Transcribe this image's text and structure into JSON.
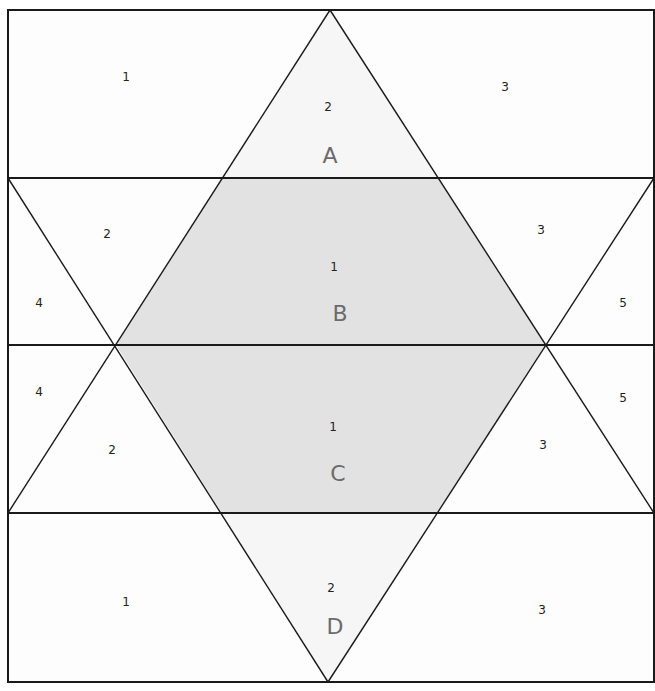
{
  "diagram": {
    "type": "quilt-block-piecing-diagram",
    "colors": {
      "line": "#1a1a1a",
      "background": "#fdfdfd",
      "shaded": "#e2e2e2",
      "number_text": "#222222",
      "section_letter": "#6b6b6b"
    },
    "sections": [
      {
        "id": "A",
        "label": "A",
        "pieces": [
          {
            "label": "1",
            "x": 126,
            "y": 81
          },
          {
            "label": "2",
            "x": 328,
            "y": 111
          },
          {
            "label": "3",
            "x": 505,
            "y": 91
          }
        ]
      },
      {
        "id": "B",
        "label": "B",
        "pieces": [
          {
            "label": "2",
            "x": 107,
            "y": 238
          },
          {
            "label": "1",
            "x": 334,
            "y": 271
          },
          {
            "label": "3",
            "x": 541,
            "y": 234
          },
          {
            "label": "4",
            "x": 39,
            "y": 307
          },
          {
            "label": "5",
            "x": 623,
            "y": 307
          }
        ]
      },
      {
        "id": "C",
        "label": "C",
        "pieces": [
          {
            "label": "4",
            "x": 39,
            "y": 396
          },
          {
            "label": "2",
            "x": 112,
            "y": 454
          },
          {
            "label": "1",
            "x": 333,
            "y": 431
          },
          {
            "label": "3",
            "x": 543,
            "y": 449
          },
          {
            "label": "5",
            "x": 623,
            "y": 402
          }
        ]
      },
      {
        "id": "D",
        "label": "D",
        "pieces": [
          {
            "label": "1",
            "x": 126,
            "y": 606
          },
          {
            "label": "2",
            "x": 331,
            "y": 592
          },
          {
            "label": "3",
            "x": 542,
            "y": 614
          }
        ]
      }
    ],
    "letter_positions": {
      "A": {
        "x": 330,
        "y": 163
      },
      "B": {
        "x": 340,
        "y": 321
      },
      "C": {
        "x": 338,
        "y": 481
      },
      "D": {
        "x": 335,
        "y": 634
      }
    }
  }
}
